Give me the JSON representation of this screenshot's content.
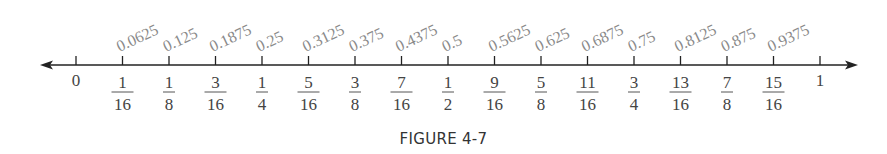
{
  "figure": {
    "caption": "FIGURE 4-7",
    "axis": {
      "min": 0,
      "max": 1,
      "arrows": "both",
      "divisions": 16
    },
    "colors": {
      "axis": "#222222",
      "decimal_label": "#8a8a8a",
      "fraction_label": "#444444"
    },
    "ticks": [
      {
        "value": 0,
        "whole": "0"
      },
      {
        "value": 0.0625,
        "decimal": "0.0625",
        "num": "1",
        "den": "16"
      },
      {
        "value": 0.125,
        "decimal": "0.125",
        "num": "1",
        "den": "8"
      },
      {
        "value": 0.1875,
        "decimal": "0.1875",
        "num": "3",
        "den": "16"
      },
      {
        "value": 0.25,
        "decimal": "0.25",
        "num": "1",
        "den": "4"
      },
      {
        "value": 0.3125,
        "decimal": "0.3125",
        "num": "5",
        "den": "16"
      },
      {
        "value": 0.375,
        "decimal": "0.375",
        "num": "3",
        "den": "8"
      },
      {
        "value": 0.4375,
        "decimal": "0.4375",
        "num": "7",
        "den": "16"
      },
      {
        "value": 0.5,
        "decimal": "0.5",
        "num": "1",
        "den": "2"
      },
      {
        "value": 0.5625,
        "decimal": "0.5625",
        "num": "9",
        "den": "16"
      },
      {
        "value": 0.625,
        "decimal": "0.625",
        "num": "5",
        "den": "8"
      },
      {
        "value": 0.6875,
        "decimal": "0.6875",
        "num": "11",
        "den": "16"
      },
      {
        "value": 0.75,
        "decimal": "0.75",
        "num": "3",
        "den": "4"
      },
      {
        "value": 0.8125,
        "decimal": "0.8125",
        "num": "13",
        "den": "16"
      },
      {
        "value": 0.875,
        "decimal": "0.875",
        "num": "7",
        "den": "8"
      },
      {
        "value": 0.9375,
        "decimal": "0.9375",
        "num": "15",
        "den": "16"
      },
      {
        "value": 1,
        "whole": "1"
      }
    ]
  }
}
